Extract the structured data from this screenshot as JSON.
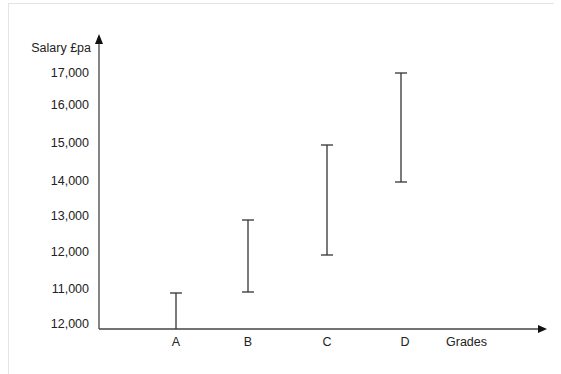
{
  "chart_data": {
    "type": "range-bar",
    "title": "",
    "ylabel": "Salary £pa",
    "xlabel": "Grades",
    "categories": [
      "A",
      "B",
      "C",
      "D"
    ],
    "series": [
      {
        "name": "min",
        "values": [
          10000,
          11000,
          12000,
          14000
        ]
      },
      {
        "name": "max",
        "values": [
          11000,
          13000,
          15000,
          17000
        ]
      }
    ],
    "ranges": [
      {
        "grade": "A",
        "min": 10000,
        "max": 11000
      },
      {
        "grade": "B",
        "min": 11000,
        "max": 13000
      },
      {
        "grade": "C",
        "min": 12000,
        "max": 15000
      },
      {
        "grade": "D",
        "min": 14000,
        "max": 17000
      }
    ],
    "y_tick_labels": [
      "12,000",
      "11,000",
      "12,000",
      "13,000",
      "14,000",
      "15,000",
      "16,000",
      "17,000"
    ],
    "ylim": [
      10000,
      17000
    ],
    "grid": false,
    "legend": null
  },
  "axis": {
    "y_title": "Salary £pa",
    "x_title": "Grades",
    "y_ticks": [
      {
        "label": "17,000",
        "y": 77
      },
      {
        "label": "16,000",
        "y": 109
      },
      {
        "label": "15,000",
        "y": 147
      },
      {
        "label": "14,000",
        "y": 185
      },
      {
        "label": "13,000",
        "y": 220
      },
      {
        "label": "12,000",
        "y": 256
      },
      {
        "label": "11,000",
        "y": 293
      },
      {
        "label": "12,000",
        "y": 328
      }
    ],
    "x_ticks": [
      {
        "label": "A",
        "x": 176
      },
      {
        "label": "B",
        "x": 248
      },
      {
        "label": "C",
        "x": 327
      },
      {
        "label": "D",
        "x": 405
      }
    ]
  },
  "bars": [
    {
      "grade": "A",
      "x": 176,
      "top": 293,
      "bottom": 329
    },
    {
      "grade": "B",
      "x": 248,
      "top": 220,
      "bottom": 292
    },
    {
      "grade": "C",
      "x": 327,
      "top": 145,
      "bottom": 255
    },
    {
      "grade": "D",
      "x": 401,
      "top": 73,
      "bottom": 182
    }
  ]
}
